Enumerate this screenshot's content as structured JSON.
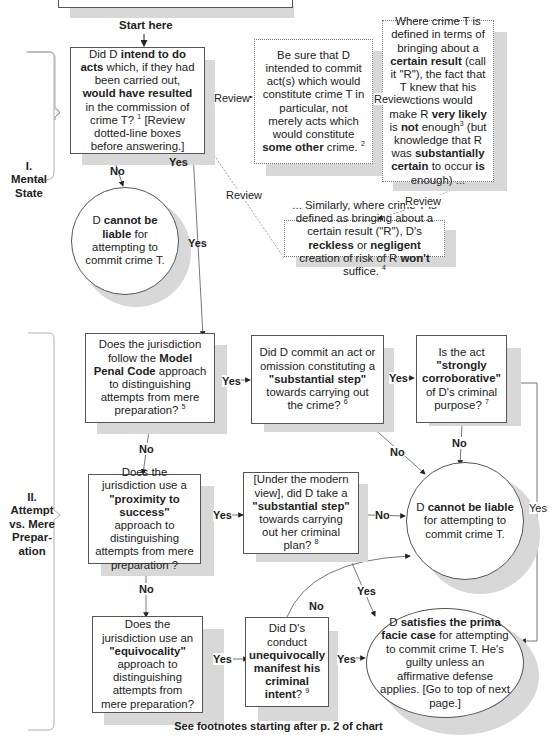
{
  "start_label": "Start here",
  "sections": [
    {
      "id": "mental-state",
      "label_lines": [
        "I.",
        "Mental",
        "State"
      ]
    },
    {
      "id": "attempt-vs-preparation",
      "label_lines": [
        "II.",
        "Attempt",
        "vs. Mere",
        "Prepar-",
        "ation"
      ]
    }
  ],
  "nodes": {
    "intent_question": {
      "parts": [
        {
          "t": "Did D ",
          "b": false
        },
        {
          "t": "intend to do acts",
          "b": true
        },
        {
          "t": " which, if they had been carried out, ",
          "b": false
        },
        {
          "t": "would have resulted",
          "b": true
        },
        {
          "t": " in the commission of crime T? ",
          "b": false
        },
        {
          "t": "1",
          "sup": true
        },
        {
          "t": " [Review dotted-line boxes before answering.]",
          "b": false
        }
      ]
    },
    "review_specific_crime": {
      "parts": [
        {
          "t": "Be sure that D intended to commit act(s) which would constitute crime T in particular, not merely acts which would constitute ",
          "b": false
        },
        {
          "t": "some other",
          "b": true
        },
        {
          "t": " crime. ",
          "b": false
        },
        {
          "t": "2",
          "sup": true
        }
      ]
    },
    "review_certain_result": {
      "parts": [
        {
          "t": "Where crime T is defined in terms of bringing about a ",
          "b": false
        },
        {
          "t": "certain result",
          "b": true
        },
        {
          "t": " (call it \"R\"), the fact that T knew that his actions would make R ",
          "b": false
        },
        {
          "t": "very likely",
          "b": true
        },
        {
          "t": " is ",
          "b": false
        },
        {
          "t": "not",
          "b": true
        },
        {
          "t": " enough",
          "b": false
        },
        {
          "t": "3",
          "sup": true
        },
        {
          "t": " (but knowledge that R was ",
          "b": false
        },
        {
          "t": "substantially certain",
          "b": true
        },
        {
          "t": " to occur ",
          "b": false
        },
        {
          "t": "is",
          "b": true
        },
        {
          "t": " enough) ...",
          "b": false
        }
      ]
    },
    "review_reckless": {
      "parts": [
        {
          "t": "... Similarly, where crime T is defined as bringing about a certain result (\"R\"), D's ",
          "b": false
        },
        {
          "t": "reckless",
          "b": true
        },
        {
          "t": " or ",
          "b": false
        },
        {
          "t": "negligent",
          "b": true
        },
        {
          "t": " creation of risk of R ",
          "b": false
        },
        {
          "t": "won't",
          "b": true
        },
        {
          "t": " suffice. ",
          "b": false
        },
        {
          "t": "4",
          "sup": true
        }
      ]
    },
    "not_liable_1": {
      "parts": [
        {
          "t": "D ",
          "b": false
        },
        {
          "t": "cannot be liable",
          "b": true
        },
        {
          "t": " for attempting to commit crime T.",
          "b": false
        }
      ]
    },
    "mpc_question": {
      "parts": [
        {
          "t": "Does the jurisdiction follow the ",
          "b": false
        },
        {
          "t": "Model Penal Code",
          "b": true
        },
        {
          "t": " approach to distinguishing attempts from mere preparation? ",
          "b": false
        },
        {
          "t": "5",
          "sup": true
        }
      ]
    },
    "substantial_step_mpc": {
      "parts": [
        {
          "t": "Did D commit an act or omission constituting a ",
          "b": false
        },
        {
          "t": "\"substantial step\"",
          "b": true
        },
        {
          "t": " towards carrying out the crime? ",
          "b": false
        },
        {
          "t": "6",
          "sup": true
        }
      ]
    },
    "strongly_corroborative": {
      "parts": [
        {
          "t": "Is the act ",
          "b": false
        },
        {
          "t": "\"strongly corroborative\"",
          "b": true
        },
        {
          "t": " of D's criminal purpose? ",
          "b": false
        },
        {
          "t": "7",
          "sup": true
        }
      ]
    },
    "proximity_question": {
      "parts": [
        {
          "t": "Does the jurisdiction use a ",
          "b": false
        },
        {
          "t": "\"proximity to success\"",
          "b": true
        },
        {
          "t": " approach to distinguishing attempts from mere preparation ?",
          "b": false
        }
      ]
    },
    "modern_view_step": {
      "parts": [
        {
          "t": "[Under the modern view], did D take a ",
          "b": false
        },
        {
          "t": "\"substantial step\"",
          "b": true
        },
        {
          "t": " towards carrying out her criminal plan? ",
          "b": false
        },
        {
          "t": "8",
          "sup": true
        }
      ]
    },
    "not_liable_2": {
      "parts": [
        {
          "t": "D ",
          "b": false
        },
        {
          "t": "cannot be liable",
          "b": true
        },
        {
          "t": " for attempting to commit crime T.",
          "b": false
        }
      ]
    },
    "equivocality_question": {
      "parts": [
        {
          "t": "Does the jurisdiction use an ",
          "b": false
        },
        {
          "t": "\"equivocality\"",
          "b": true
        },
        {
          "t": " approach to distinguishing attempts from mere preparation?",
          "b": false
        }
      ]
    },
    "unequivocal_intent": {
      "parts": [
        {
          "t": "Did D's conduct ",
          "b": false
        },
        {
          "t": "unequivocally manifest his criminal intent",
          "b": true
        },
        {
          "t": "? ",
          "b": false
        },
        {
          "t": "9",
          "sup": true
        }
      ]
    },
    "prima_facie": {
      "parts": [
        {
          "t": "D ",
          "b": false
        },
        {
          "t": "satisfies the prima facie case",
          "b": true
        },
        {
          "t": " for attempting to commit crime T. He's guilty unless an affirmative defense applies. [Go to top of next page.]",
          "b": false
        }
      ]
    }
  },
  "edge_labels": {
    "review_1": "Review",
    "review_2": "Review",
    "review_3": "Review",
    "review_4": "Review",
    "intent_no": "No",
    "intent_yes_a": "Yes",
    "intent_yes_b": "Yes",
    "mpc_yes": "Yes",
    "mpc_no": "No",
    "step_yes": "Yes",
    "step_no": "No",
    "corrob_no": "No",
    "corrob_yes": "Yes",
    "prox_yes": "Yes",
    "prox_no": "No",
    "modern_no": "No",
    "modern_yes": "Yes",
    "equiv_yes": "Yes",
    "unequiv_no": "No",
    "unequiv_yes": "Yes"
  },
  "footer": "See footnotes starting after p. 2 of chart"
}
